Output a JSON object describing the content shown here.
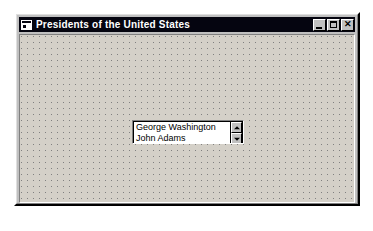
{
  "window": {
    "title": "Presidents of the United States",
    "icon": "vb-form-icon",
    "titlebar_color": "#050510",
    "titlebar_text_color": "#ffffff",
    "face_color": "#c0c0c0",
    "form_surface_color": "#d4d0c8",
    "grid_dot_color": "#808080",
    "controls": {
      "minimize_label": "_",
      "maximize_label": "",
      "close_label": "✕"
    }
  },
  "form": {
    "listbox": {
      "name": "presidents-listbox",
      "items": [
        "George Washington",
        "John Adams"
      ],
      "scrollbar": {
        "up_arrow": "scroll-up-icon",
        "down_arrow": "scroll-down-icon"
      }
    }
  }
}
